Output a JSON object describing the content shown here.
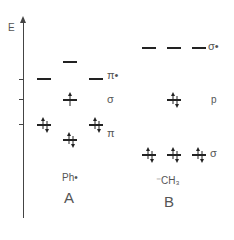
{
  "axis": {
    "label": "E"
  },
  "panel_a": {
    "title": "A",
    "species": "Ph•",
    "labels": {
      "pi_star": "π•",
      "sigma": "σ",
      "pi": "π"
    }
  },
  "panel_b": {
    "title": "B",
    "species": "⁻CH₃",
    "labels": {
      "sigma_star": "σ•",
      "p": "p",
      "sigma": "σ"
    }
  }
}
